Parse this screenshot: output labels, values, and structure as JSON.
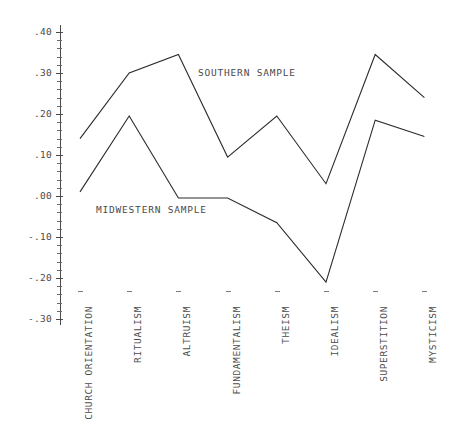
{
  "chart_data": {
    "type": "line",
    "title": "",
    "subtitle": "",
    "xlabel": "",
    "ylabel": "",
    "grid": false,
    "legend_position": "inline-annotations",
    "categories": [
      "CHURCH ORIENTATION",
      "RITUALISM",
      "ALTRUISM",
      "FUNDAMENTALISM",
      "THEISM",
      "IDEALISM",
      "SUPERSTITION",
      "MYSTICISM"
    ],
    "ylim": [
      -0.3,
      0.4
    ],
    "ytick_labels": [
      ".40",
      ".30",
      ".20",
      ".10",
      ".00",
      "-.10",
      "-.20",
      "-.30"
    ],
    "ytick_values": [
      0.4,
      0.3,
      0.2,
      0.1,
      0.0,
      -0.1,
      -0.2,
      -0.3
    ],
    "yminor_step": 0.02,
    "series": [
      {
        "name": "SOUTHERN SAMPLE",
        "values": [
          0.14,
          0.3,
          0.345,
          0.095,
          0.195,
          0.03,
          0.345,
          0.24
        ]
      },
      {
        "name": "MIDWESTERN SAMPLE",
        "values": [
          0.01,
          0.195,
          -0.005,
          -0.005,
          -0.065,
          -0.21,
          0.185,
          0.145
        ]
      }
    ],
    "annotations": [
      {
        "text": "SOUTHERN SAMPLE",
        "series": "SOUTHERN SAMPLE"
      },
      {
        "text": "MIDWESTERN SAMPLE",
        "series": "MIDWESTERN SAMPLE"
      }
    ],
    "colors": {
      "line": "#2b2b2b",
      "axis": "#4a4a4a",
      "text": "#4a4a4a",
      "background": "#ffffff"
    }
  },
  "axis": {
    "y_labels": [
      {
        "text": ".40"
      },
      {
        "text": ".30"
      },
      {
        "text": ".20"
      },
      {
        "text": ".10"
      },
      {
        "text": ".00"
      },
      {
        "text": "-.10"
      },
      {
        "text": "-.20"
      },
      {
        "text": "-.30"
      }
    ]
  },
  "annotations": {
    "southern": "SOUTHERN SAMPLE",
    "midwestern": "MIDWESTERN SAMPLE"
  }
}
